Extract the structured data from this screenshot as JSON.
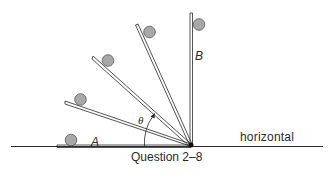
{
  "figure": {
    "caption": "Question 2–8",
    "labels": {
      "start_position": "A",
      "end_position": "B",
      "angle": "θ",
      "reference_line": "horizontal"
    }
  },
  "colors": {
    "line": "#2a2a2a",
    "ball_fill": "#a8a8a8",
    "ball_stroke": "#555555",
    "background": "#ffffff"
  },
  "elements": {
    "pivot": "pivot-point",
    "ramp_positions": [
      "horizontal-A",
      "ramp-low",
      "ramp-mid",
      "ramp-high",
      "vertical-B"
    ],
    "balls_count": 5
  }
}
